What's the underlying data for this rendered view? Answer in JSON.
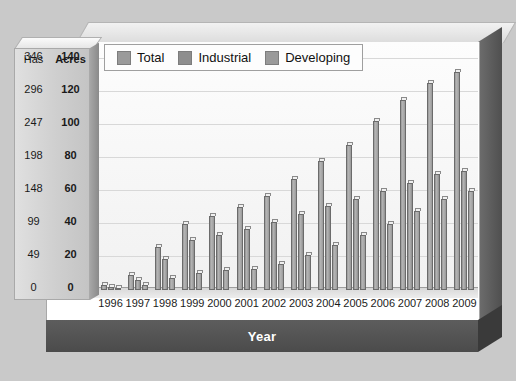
{
  "chart_data": {
    "type": "bar",
    "title": "",
    "xlabel": "Year",
    "ylabel": "",
    "grid": true,
    "legend_position": "top-left",
    "categories": [
      "1996",
      "1997",
      "1998",
      "1999",
      "2000",
      "2001",
      "2002",
      "2003",
      "2004",
      "2005",
      "2006",
      "2007",
      "2008",
      "2009"
    ],
    "series": [
      {
        "name": "Total",
        "values": [
          3,
          9,
          26,
          40,
          45,
          50,
          57,
          67,
          78,
          88,
          102,
          115,
          125,
          132
        ]
      },
      {
        "name": "Industrial",
        "values": [
          2,
          6,
          19,
          30,
          33,
          37,
          41,
          46,
          51,
          55,
          60,
          65,
          70,
          72
        ]
      },
      {
        "name": "Developing",
        "values": [
          1,
          3,
          7,
          10,
          12,
          13,
          16,
          21,
          27,
          33,
          40,
          48,
          55,
          60
        ]
      }
    ],
    "y_axes": [
      {
        "name": "Has",
        "ticks": [
          "0",
          "49",
          "99",
          "148",
          "198",
          "247",
          "296",
          "346"
        ],
        "bold": false
      },
      {
        "name": "Acres",
        "ticks": [
          "0",
          "20",
          "40",
          "60",
          "80",
          "100",
          "120",
          "140"
        ],
        "bold": true
      }
    ],
    "ylim_acres": [
      0,
      150
    ],
    "colors": {
      "total": "#9a9a9a",
      "industrial": "#8e8e8e",
      "developing": "#9a9a9a",
      "panel": "#ffffff",
      "background": "#c9c9c9",
      "year_band": "#4f4f4f",
      "gridline": "#d8d8d8"
    }
  },
  "legend": {
    "items": [
      {
        "label": "Total",
        "swatch": "#9a9a9a"
      },
      {
        "label": "Industrial",
        "swatch": "#8e8e8e"
      },
      {
        "label": "Developing",
        "swatch": "#9a9a9a"
      }
    ]
  },
  "axis_box": {
    "header_has": "Has",
    "header_acres": "Acres"
  },
  "footer": {
    "year_label": "Year"
  }
}
